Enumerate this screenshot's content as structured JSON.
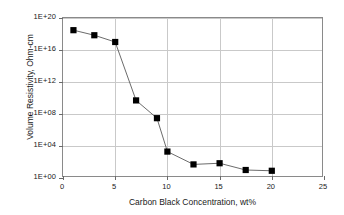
{
  "chart_data": {
    "type": "line",
    "title": "",
    "xlabel": "Carbon Black Concentration, wt%",
    "ylabel": "Volume Resistivity, Ohm-cm",
    "xlim": [
      0,
      25
    ],
    "ylim": [
      1,
      1e+20
    ],
    "yscale": "log",
    "xscale": "linear",
    "grid": true,
    "legend": "none",
    "marker": "filled-square",
    "line_color": "#5a5a5a",
    "marker_color": "#000000",
    "xticks": [
      "0",
      "5",
      "10",
      "15",
      "20",
      "25"
    ],
    "xtick_values": [
      0,
      5,
      10,
      15,
      20,
      25
    ],
    "yticks": [
      "1E+00",
      "1E+04",
      "1E+08",
      "1E+12",
      "1E+16",
      "1E+20"
    ],
    "ytick_values": [
      1.0,
      10000.0,
      100000000.0,
      1000000000000.0,
      1e+16,
      1e+20
    ],
    "x": [
      1,
      3,
      5,
      7,
      9,
      10,
      12.5,
      15,
      17.5,
      20
    ],
    "values": [
      3e+18,
      7e+17,
      1e+17,
      5000000000.0,
      30000000.0,
      2000.0,
      50,
      70,
      10,
      8
    ],
    "series": [
      {
        "name": "Volume Resistivity",
        "points": [
          {
            "x": 1,
            "y": 3e+18
          },
          {
            "x": 3,
            "y": 7e+17
          },
          {
            "x": 5,
            "y": 1e+17
          },
          {
            "x": 7,
            "y": 5000000000.0
          },
          {
            "x": 9,
            "y": 30000000.0
          },
          {
            "x": 10,
            "y": 2000.0
          },
          {
            "x": 12.5,
            "y": 50
          },
          {
            "x": 15,
            "y": 70
          },
          {
            "x": 17.5,
            "y": 10
          },
          {
            "x": 20,
            "y": 8
          }
        ]
      }
    ]
  }
}
